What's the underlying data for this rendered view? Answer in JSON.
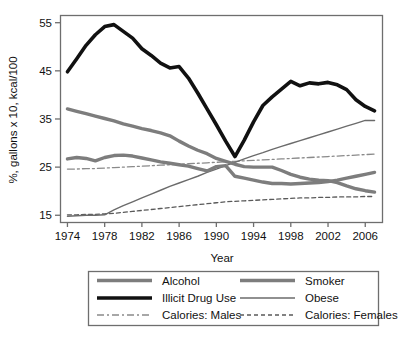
{
  "chart_data": {
    "type": "line",
    "title": "",
    "xlabel": "Year",
    "ylabel": "%, gallons x 10, kcal/100",
    "xlim": [
      1973.2,
      2007.8
    ],
    "ylim": [
      13.6,
      56.6
    ],
    "xticks": [
      1974,
      1978,
      1982,
      1986,
      1990,
      1994,
      1998,
      2002,
      2006
    ],
    "yticks": [
      15,
      25,
      35,
      45,
      55
    ],
    "grid": false,
    "legend_position": "below-outside",
    "x": [
      1974,
      1975,
      1976,
      1977,
      1978,
      1979,
      1980,
      1981,
      1982,
      1983,
      1984,
      1985,
      1986,
      1987,
      1988,
      1989,
      1990,
      1991,
      1992,
      1993,
      1994,
      1995,
      1996,
      1997,
      1998,
      1999,
      2000,
      2001,
      2002,
      2003,
      2004,
      2005,
      2006,
      2007
    ],
    "series": [
      {
        "name": "Alcohol",
        "color": "#7d7d7d",
        "width": 3.4,
        "dash": "none",
        "values": [
          26.7,
          27.0,
          26.8,
          26.3,
          27.0,
          27.4,
          27.5,
          27.3,
          26.9,
          26.5,
          26.1,
          25.8,
          25.5,
          25.2,
          24.7,
          24.2,
          25.1,
          25.3,
          23.1,
          22.7,
          22.3,
          21.9,
          21.6,
          21.6,
          21.5,
          21.6,
          21.7,
          21.8,
          22.0,
          22.3,
          22.7,
          23.1,
          23.5,
          23.9
        ]
      },
      {
        "name": "Illicit Drug Use",
        "color": "#111111",
        "width": 3.6,
        "dash": "none",
        "values": [
          44.8,
          47.5,
          50.3,
          52.5,
          54.2,
          54.6,
          53.2,
          51.8,
          49.6,
          48.2,
          46.6,
          45.6,
          45.9,
          43.5,
          40.4,
          37.1,
          33.8,
          30.4,
          27.2,
          30.6,
          34.4,
          37.8,
          39.6,
          41.2,
          42.8,
          41.9,
          42.5,
          42.3,
          42.6,
          42.1,
          41.1,
          39.0,
          37.6,
          36.7
        ]
      },
      {
        "name": "Smoker",
        "color": "#7d7d7d",
        "width": 3.4,
        "dash": "none",
        "values": [
          37.1,
          36.6,
          36.1,
          35.6,
          35.1,
          34.6,
          34.0,
          33.5,
          33.0,
          32.6,
          32.1,
          31.5,
          30.4,
          29.4,
          28.5,
          27.8,
          26.8,
          26.2,
          25.6,
          25.1,
          25.0,
          25.0,
          25.0,
          24.3,
          23.5,
          22.9,
          22.5,
          22.3,
          22.2,
          21.8,
          21.1,
          20.5,
          20.1,
          19.8
        ]
      },
      {
        "name": "Obese",
        "color": "#6b6b6b",
        "width": 1.4,
        "dash": "none",
        "values": [
          14.8,
          14.9,
          15.0,
          15.0,
          15.1,
          16.1,
          17.0,
          17.8,
          18.6,
          19.4,
          20.2,
          21.0,
          21.7,
          22.4,
          23.1,
          23.9,
          24.6,
          25.3,
          26.0,
          26.7,
          27.4,
          28.0,
          28.7,
          29.3,
          29.9,
          30.5,
          31.1,
          31.7,
          32.3,
          32.9,
          33.5,
          34.1,
          34.7,
          34.7
        ]
      },
      {
        "name": "Calories: Males",
        "color": "#8a8a8a",
        "width": 1.3,
        "dash": "7,3,2,3",
        "values": [
          24.6,
          24.6,
          24.7,
          24.7,
          24.8,
          24.9,
          25.0,
          25.1,
          25.2,
          25.3,
          25.4,
          25.5,
          25.6,
          25.7,
          25.8,
          25.9,
          26.0,
          26.1,
          26.2,
          26.3,
          26.4,
          26.5,
          26.6,
          26.7,
          26.8,
          26.9,
          27.0,
          27.1,
          27.2,
          27.3,
          27.4,
          27.5,
          27.6,
          27.7
        ]
      },
      {
        "name": "Calories: Females",
        "color": "#5a5a5a",
        "width": 1.3,
        "dash": "4,3",
        "values": [
          15.1,
          15.1,
          15.2,
          15.2,
          15.3,
          15.4,
          15.6,
          15.8,
          16.0,
          16.2,
          16.4,
          16.6,
          16.8,
          17.0,
          17.2,
          17.4,
          17.6,
          17.8,
          17.9,
          18.0,
          18.1,
          18.2,
          18.3,
          18.4,
          18.5,
          18.6,
          18.6,
          18.7,
          18.7,
          18.8,
          18.8,
          18.8,
          18.9,
          18.9
        ]
      }
    ]
  },
  "legend": {
    "items": [
      {
        "label": "Alcohol",
        "key": "Alcohol"
      },
      {
        "label": "Smoker",
        "key": "Smoker"
      },
      {
        "label": "Illicit Drug Use",
        "key": "Illicit Drug Use"
      },
      {
        "label": "Obese",
        "key": "Obese"
      },
      {
        "label": "Calories: Males",
        "key": "Calories: Males"
      },
      {
        "label": "Calories: Females",
        "key": "Calories: Females"
      }
    ]
  },
  "axes": {
    "x_title": "Year",
    "y_title": "%, gallons x 10, kcal/100",
    "x_tick_labels": [
      "1974",
      "1978",
      "1982",
      "1986",
      "1990",
      "1994",
      "1998",
      "2002",
      "2006"
    ],
    "y_tick_labels": [
      "15",
      "25",
      "35",
      "45",
      "55"
    ]
  },
  "style": {
    "frame_color": "#6e6e6e",
    "text_color": "#111111",
    "background": "#ffffff"
  }
}
